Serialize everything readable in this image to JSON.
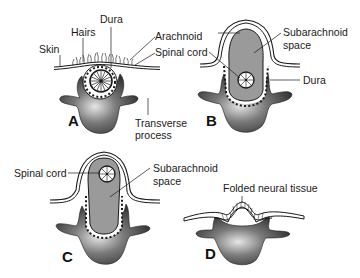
{
  "figure": {
    "panels": [
      {
        "id": "A",
        "letter": "A",
        "labels": {
          "skin": "Skin",
          "hairs": "Hairs",
          "dura": "Dura",
          "arachnoid": "Arachnoid",
          "spinal_cord": "Spinal cord",
          "transverse_process_line1": "Transverse",
          "transverse_process_line2": "process"
        }
      },
      {
        "id": "B",
        "letter": "B",
        "labels": {
          "subarachnoid_line1": "Subarachnoid",
          "subarachnoid_line2": "space",
          "dura": "Dura"
        }
      },
      {
        "id": "C",
        "letter": "C",
        "labels": {
          "spinal_cord": "Spinal cord",
          "subarachnoid_line1": "Subarachnoid",
          "subarachnoid_line2": "space"
        }
      },
      {
        "id": "D",
        "letter": "D",
        "labels": {
          "folded_neural_tissue": "Folded neural tissue"
        }
      }
    ],
    "colors": {
      "bone": "#3a3a3a",
      "bone_highlight": "#d9d9d9",
      "sac_fill": "#9a9a9a",
      "line": "#1a1a1a",
      "background": "#ffffff"
    }
  }
}
